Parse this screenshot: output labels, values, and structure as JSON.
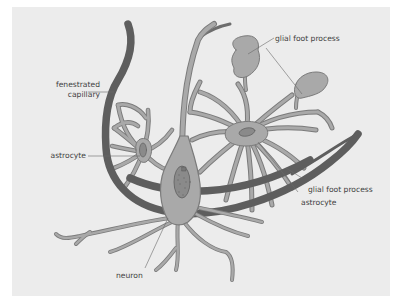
{
  "figure": {
    "title": "",
    "colors": {
      "page_background": "#ffffff",
      "panel_background": "#ececec",
      "capillary": "#5e5e5e",
      "cell_fill": "#a9a9a9",
      "cell_outline": "#7b7b7b",
      "nucleus": "#8a8a8a",
      "leader_line": "#6a6a6a",
      "label_text": "#3f3f3f"
    }
  },
  "labels": {
    "fenestrated_capillary_line1": "fenestrated",
    "fenestrated_capillary_line2": "capillary",
    "astrocyte_left": "astrocyte",
    "glial_foot_process_top": "glial foot process",
    "glial_foot_process_right": "glial foot process",
    "astrocyte_right": "astrocyte",
    "neuron": "neuron"
  },
  "structures": [
    {
      "name": "fenestrated capillary",
      "shape": "curved vessel band"
    },
    {
      "name": "astrocyte (left)",
      "shape": "small star-shaped cell"
    },
    {
      "name": "astrocyte (right)",
      "shape": "large star-shaped cell with radiating processes"
    },
    {
      "name": "neuron",
      "shape": "pyramidal soma with dendrites and nucleus"
    },
    {
      "name": "glial foot process (top)",
      "count": 2
    }
  ]
}
